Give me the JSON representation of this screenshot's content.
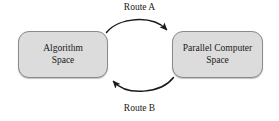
{
  "diagram": {
    "background_color": "#ffffff",
    "node_fill_color": "#dcdcdc",
    "node_border_color": "#8a8a8a",
    "edge_color": "#1a1a1a",
    "text_color": "#1a1a1a",
    "nodes": [
      {
        "id": "algorithm-space",
        "line1": "Algorithm",
        "line2": "Space"
      },
      {
        "id": "parallel-computer-space",
        "line1": "Parallel Computer",
        "line2": "Space"
      }
    ],
    "edges": [
      {
        "id": "route-a",
        "label": "Route A",
        "from": "algorithm-space",
        "to": "parallel-computer-space",
        "direction": "left-to-right",
        "position": "top",
        "arrowhead": "filled-triangle"
      },
      {
        "id": "route-b",
        "label": "Route B",
        "from": "parallel-computer-space",
        "to": "algorithm-space",
        "direction": "right-to-left",
        "position": "bottom",
        "arrowhead": "filled-triangle"
      }
    ]
  }
}
